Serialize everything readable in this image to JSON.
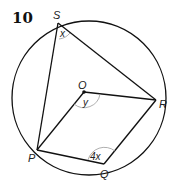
{
  "problem_number": "10",
  "points": {
    "S": {
      "label": "S",
      "x": 58,
      "y": 23
    },
    "R": {
      "label": "R",
      "x": 156,
      "y": 100
    },
    "P": {
      "label": "P",
      "x": 37,
      "y": 150
    },
    "Q": {
      "label": "Q",
      "x": 104,
      "y": 164
    },
    "O": {
      "label": "O",
      "x": 84,
      "y": 92
    }
  },
  "angles": {
    "at_S": "x",
    "at_O": "y",
    "at_Q": "4x"
  },
  "colors": {
    "line": "#111111",
    "arc": "#9a9a9a"
  }
}
